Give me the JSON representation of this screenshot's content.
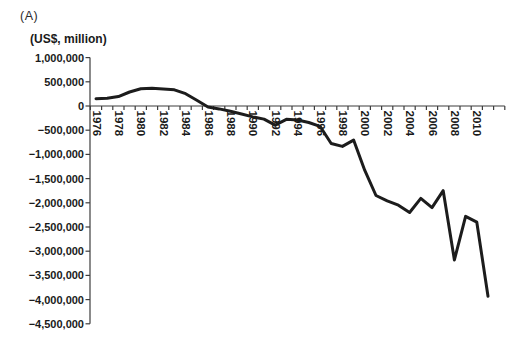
{
  "panel_label": "(A)",
  "chart_data": {
    "type": "line",
    "title": "",
    "xlabel": "",
    "ylabel": "(US$, million)",
    "grid": false,
    "legend_position": "none",
    "line_color": "#1c1c1c",
    "line_width": 3,
    "ylim": [
      -4500000,
      1000000
    ],
    "ytick_step": 500000,
    "x": [
      1976,
      1977,
      1978,
      1979,
      1980,
      1981,
      1982,
      1983,
      1984,
      1985,
      1986,
      1987,
      1988,
      1989,
      1990,
      1991,
      1992,
      1993,
      1994,
      1995,
      1996,
      1997,
      1998,
      1999,
      2000,
      2001,
      2002,
      2003,
      2004,
      2005,
      2006,
      2007,
      2008,
      2009,
      2010,
      2011
    ],
    "series": [
      {
        "name": "net-international-position",
        "values": [
          150000,
          160000,
          195000,
          290000,
          355000,
          365000,
          350000,
          335000,
          255000,
          120000,
          -20000,
          -60000,
          -110000,
          -165000,
          -225000,
          -270000,
          -395000,
          -275000,
          -290000,
          -340000,
          -420000,
          -775000,
          -835000,
          -705000,
          -1330000,
          -1850000,
          -1960000,
          -2050000,
          -2200000,
          -1910000,
          -2100000,
          -1750000,
          -3180000,
          -2280000,
          -2400000,
          -3930000
        ]
      }
    ],
    "yticks": [
      {
        "value": 1000000,
        "label": "1,000,000"
      },
      {
        "value": 500000,
        "label": "500,000"
      },
      {
        "value": 0,
        "label": "0"
      },
      {
        "value": -500000,
        "label": "−500,000"
      },
      {
        "value": -1000000,
        "label": "−1,000,000"
      },
      {
        "value": -1500000,
        "label": "−1,500,000"
      },
      {
        "value": -2000000,
        "label": "−2,000,000"
      },
      {
        "value": -2500000,
        "label": "−2,500,000"
      },
      {
        "value": -3000000,
        "label": "−3,000,000"
      },
      {
        "value": -3500000,
        "label": "−3,500,000"
      },
      {
        "value": -4000000,
        "label": "−4,000,000"
      },
      {
        "value": -4500000,
        "label": "−4,500,000"
      }
    ],
    "xtick_labels": [
      "1976",
      "1978",
      "1980",
      "1982",
      "1984",
      "1986",
      "1988",
      "1990",
      "1992",
      "1994",
      "1996",
      "1998",
      "2000",
      "2002",
      "2004",
      "2006",
      "2008",
      "2010"
    ]
  }
}
